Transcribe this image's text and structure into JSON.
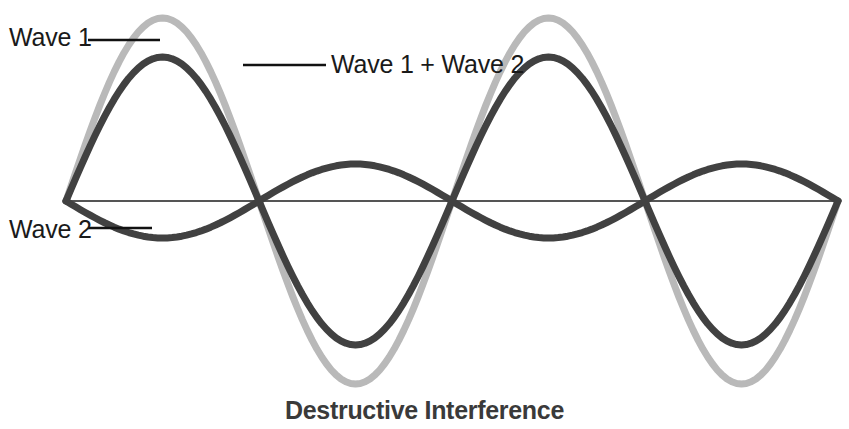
{
  "figure": {
    "caption": "Destructive Interference",
    "background_color": "#ffffff"
  },
  "labels": {
    "wave1": "Wave 1",
    "wave2": "Wave 2",
    "sum": "Wave 1 + Wave 2"
  },
  "colors": {
    "wave1": "#b9b9b9",
    "wave2": "#414141",
    "sum": "#414141",
    "axis": "#1c1c1c",
    "leader": "#111111",
    "caption": "#3a3a3a",
    "label_text": "#1a1a1a"
  },
  "chart_data": {
    "type": "line",
    "title": "Destructive Interference",
    "xlabel": "",
    "ylabel": "",
    "grid": false,
    "legend_position": "inline-callouts",
    "axis": {
      "baseline_y": 201,
      "x_start": 66,
      "x_end": 838,
      "zero_crossings": [
        66,
        330,
        585,
        838
      ]
    },
    "x_domain": [
      0,
      2
    ],
    "y_domain": [
      -190,
      190
    ],
    "series": [
      {
        "name": "Wave 1",
        "color": "#b9b9b9",
        "amplitude": 183,
        "phase": "positive-sine",
        "stroke_width": 7,
        "description": "Larger-amplitude wave, crest then trough then crest",
        "key_points": [
          {
            "x": 66,
            "y": 0
          },
          {
            "x": 198,
            "y": 183
          },
          {
            "x": 330,
            "y": 0
          },
          {
            "x": 458,
            "y": -183
          },
          {
            "x": 585,
            "y": 0
          },
          {
            "x": 712,
            "y": 183
          },
          {
            "x": 838,
            "y": 0
          }
        ]
      },
      {
        "name": "Wave 2",
        "color": "#414141",
        "amplitude": 37,
        "phase": "inverted-sine",
        "stroke_width": 7,
        "description": "Smaller-amplitude wave, 180 degrees out of phase with Wave 1",
        "key_points": [
          {
            "x": 66,
            "y": 0
          },
          {
            "x": 198,
            "y": -37
          },
          {
            "x": 330,
            "y": 0
          },
          {
            "x": 458,
            "y": 34
          },
          {
            "x": 585,
            "y": 0
          },
          {
            "x": 712,
            "y": -37
          },
          {
            "x": 838,
            "y": 0
          }
        ]
      },
      {
        "name": "Wave 1 + Wave 2",
        "color": "#414141",
        "amplitude": 144,
        "phase": "positive-sine",
        "stroke_width": 7,
        "description": "Resultant sum wave with reduced amplitude due to destructive interference",
        "key_points": [
          {
            "x": 66,
            "y": 0
          },
          {
            "x": 198,
            "y": 144
          },
          {
            "x": 330,
            "y": 0
          },
          {
            "x": 458,
            "y": -144
          },
          {
            "x": 585,
            "y": 0
          },
          {
            "x": 712,
            "y": 144
          },
          {
            "x": 838,
            "y": 0
          }
        ]
      }
    ],
    "annotations": [
      {
        "text": "Wave 1",
        "target_series": "Wave 1",
        "leader_from": [
          88,
          40
        ],
        "leader_to": [
          160,
          40
        ]
      },
      {
        "text": "Wave 2",
        "target_series": "Wave 2",
        "leader_from": [
          88,
          228
        ],
        "leader_to": [
          152,
          228
        ]
      },
      {
        "text": "Wave 1 + Wave 2",
        "target_series": "Wave 1 + Wave 2",
        "leader_from": [
          243,
          65
        ],
        "leader_to": [
          326,
          65
        ]
      }
    ]
  }
}
